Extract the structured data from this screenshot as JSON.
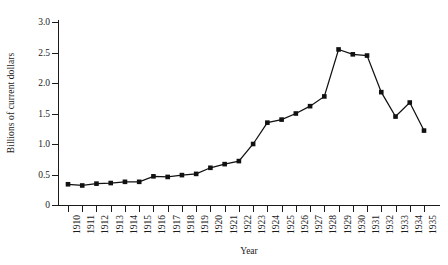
{
  "chart_data": {
    "type": "line",
    "title": "",
    "xlabel": "Year",
    "ylabel": "Billions of current dollars",
    "categories": [
      1910,
      1911,
      1912,
      1913,
      1914,
      1915,
      1916,
      1917,
      1918,
      1919,
      1920,
      1921,
      1922,
      1923,
      1924,
      1925,
      1926,
      1927,
      1928,
      1929,
      1930,
      1931,
      1932,
      1933,
      1934,
      1935
    ],
    "x_tick_labels": [
      "1910",
      "1911",
      "1912",
      "1913",
      "1914",
      "1915",
      "1916",
      "1917",
      "1918",
      "1919",
      "1920",
      "1921",
      "1922",
      "1923",
      "1924",
      "1925",
      "1926",
      "1927",
      "1928",
      "1929",
      "1930",
      "1931",
      "1932",
      "1933",
      "1934",
      "1935"
    ],
    "values": [
      0.34,
      0.32,
      0.35,
      0.36,
      0.38,
      0.38,
      0.47,
      0.46,
      0.49,
      0.51,
      0.61,
      0.67,
      0.72,
      1.0,
      1.35,
      1.4,
      1.5,
      1.62,
      1.78,
      2.55,
      2.47,
      2.45,
      1.85,
      1.45,
      1.68,
      1.22
    ],
    "y_tick_labels": [
      "0",
      "0.5",
      "1.0",
      "1.5",
      "2.0",
      "2.5",
      "3.0"
    ],
    "y_tick_values": [
      0,
      0.5,
      1.0,
      1.5,
      2.0,
      2.5,
      3.0
    ],
    "ylim": [
      0,
      3.15
    ],
    "grid": false,
    "legend": false,
    "marker": "square",
    "line_color": "#111111",
    "marker_color": "#111111",
    "axis_color": "#1a1a1a",
    "background_color": "#ffffff"
  }
}
